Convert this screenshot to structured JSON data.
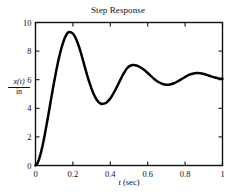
{
  "chart_data": {
    "type": "line",
    "title": "Step Response",
    "xlabel": "t (sec)",
    "ylabel": "x(t)/in",
    "ylabel_numerator": "x(t)",
    "ylabel_denominator": "in",
    "xlim": [
      0,
      1
    ],
    "ylim": [
      0,
      10
    ],
    "grid": false,
    "legend": "none",
    "xticks": [
      0,
      0.2,
      0.4,
      0.6,
      0.8,
      1
    ],
    "xticklabels": [
      "0",
      "0.2",
      "0.4",
      "0.6",
      "0.8",
      "1"
    ],
    "yticks": [
      0,
      2,
      4,
      6,
      8,
      10
    ],
    "yticklabels": [
      "0",
      "2",
      "4",
      "6",
      "8",
      "10"
    ],
    "series": [
      {
        "name": "step response",
        "color": "#000000",
        "x": [
          0,
          0.01,
          0.02,
          0.03,
          0.04,
          0.05,
          0.06,
          0.07,
          0.08,
          0.09,
          0.1,
          0.11,
          0.12,
          0.13,
          0.14,
          0.15,
          0.16,
          0.17,
          0.18,
          0.19,
          0.2,
          0.21,
          0.22,
          0.23,
          0.24,
          0.25,
          0.26,
          0.27,
          0.28,
          0.29,
          0.3,
          0.31,
          0.32,
          0.33,
          0.34,
          0.35,
          0.36,
          0.37,
          0.38,
          0.39,
          0.4,
          0.41,
          0.42,
          0.43,
          0.44,
          0.45,
          0.46,
          0.47,
          0.48,
          0.49,
          0.5,
          0.52,
          0.54,
          0.56,
          0.58,
          0.6,
          0.62,
          0.64,
          0.66,
          0.68,
          0.7,
          0.72,
          0.74,
          0.76,
          0.78,
          0.8,
          0.82,
          0.84,
          0.86,
          0.88,
          0.9,
          0.92,
          0.94,
          0.96,
          0.98,
          1.0
        ],
        "y": [
          0.0,
          0.15,
          0.48,
          0.95,
          1.52,
          2.18,
          2.9,
          3.64,
          4.4,
          5.15,
          5.88,
          6.56,
          7.2,
          7.77,
          8.27,
          8.69,
          9.02,
          9.24,
          9.33,
          9.31,
          9.22,
          9.03,
          8.76,
          8.41,
          8.0,
          7.55,
          7.07,
          6.6,
          6.15,
          5.74,
          5.36,
          5.03,
          4.76,
          4.55,
          4.4,
          4.32,
          4.31,
          4.34,
          4.41,
          4.53,
          4.69,
          4.89,
          5.12,
          5.37,
          5.63,
          5.89,
          6.15,
          6.4,
          6.62,
          6.8,
          6.93,
          7.02,
          6.99,
          6.87,
          6.69,
          6.47,
          6.23,
          6.0,
          5.82,
          5.7,
          5.65,
          5.67,
          5.75,
          5.88,
          6.03,
          6.19,
          6.33,
          6.42,
          6.46,
          6.45,
          6.4,
          6.32,
          6.23,
          6.15,
          6.09,
          6.06
        ]
      }
    ],
    "annotations": {
      "first_peak": {
        "t": 0.18,
        "value": 9.33
      },
      "first_trough": {
        "t": 0.355,
        "value": 4.31
      },
      "second_peak": {
        "t": 0.52,
        "value": 7.02
      },
      "second_trough": {
        "t": 0.7,
        "value": 5.65
      },
      "third_peak": {
        "t": 0.86,
        "value": 6.46
      },
      "steady_state": {
        "t": 1.0,
        "value": 6.06
      }
    }
  },
  "figure": {
    "background_color": "#ffffff",
    "axis_color": "#111111",
    "line_color": "#000000"
  }
}
